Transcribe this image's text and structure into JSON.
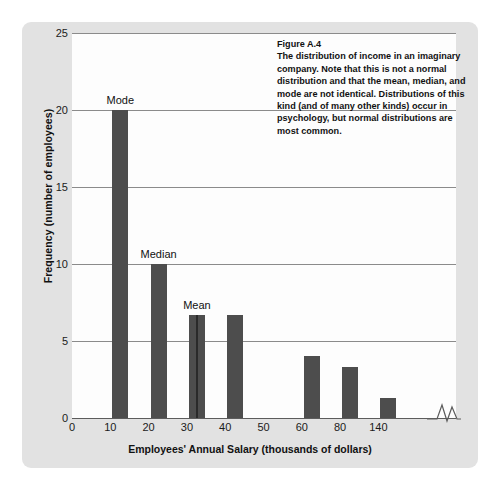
{
  "figure": {
    "caption_title": "Figure A.4",
    "caption_body": "The distribution of income in an imaginary company. Note that this is not a normal distribution and that the mean, median, and mode are not identical. Distributions of this kind (and of many other kinds) occur in psychology, but normal distributions are most common."
  },
  "colors": {
    "bar": "#4d4d4d",
    "panel": "#e2e2e2",
    "plot_background": "#fdfdfd",
    "gridline": "#8b8b8b",
    "text": "#111111"
  },
  "chart_data": {
    "type": "bar",
    "title": "",
    "xlabel": "Employees' Annual Salary (thousands of dollars)",
    "ylabel": "Frequency (number of employees)",
    "categories": [
      "0",
      "10",
      "20",
      "30",
      "40",
      "50",
      "60",
      "80",
      "140"
    ],
    "values": [
      0,
      20,
      10,
      6.7,
      6.7,
      0,
      4,
      3.3,
      1.3
    ],
    "ylim": [
      0,
      25
    ],
    "yticks": [
      "0",
      "5",
      "10",
      "15",
      "20",
      "25"
    ],
    "xticks": [
      "0",
      "10",
      "20",
      "30",
      "40",
      "50",
      "60",
      "80",
      "140"
    ],
    "grid": true,
    "legend": "none",
    "axis_break": {
      "present": true,
      "between": [
        "80",
        "140"
      ],
      "label": "axis-break-zigzag"
    },
    "annotations": [
      {
        "label": "Mode",
        "category": "10",
        "value": 20
      },
      {
        "label": "Median",
        "category": "20",
        "value": 10
      },
      {
        "label": "Mean",
        "category": "30",
        "value": 6.7
      }
    ]
  }
}
